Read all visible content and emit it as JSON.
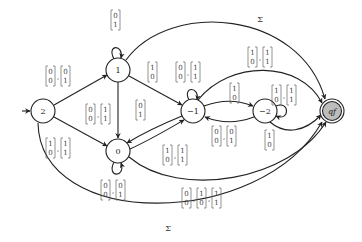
{
  "diagram": {
    "type": "finite-automaton",
    "start_state": "2",
    "states": [
      {
        "id": "2",
        "label": "2",
        "x": 43,
        "y": 111,
        "final": false,
        "start": true
      },
      {
        "id": "1",
        "label": "1",
        "x": 118,
        "y": 70,
        "final": false
      },
      {
        "id": "0",
        "label": "0",
        "x": 118,
        "y": 151,
        "final": false
      },
      {
        "id": "-1",
        "label": "−1",
        "x": 193,
        "y": 111,
        "final": false
      },
      {
        "id": "-2",
        "label": "−2",
        "x": 265,
        "y": 111,
        "final": false
      },
      {
        "id": "qf",
        "label": "qₑ",
        "display": "qf",
        "x": 332,
        "y": 111,
        "final": true
      }
    ],
    "edges": [
      {
        "from": "2",
        "to": "1",
        "label": "[0 0],[0 1]"
      },
      {
        "from": "2",
        "to": "0",
        "label": "[1 0],[1 1]"
      },
      {
        "from": "2",
        "to": "qf",
        "label": "Σ"
      },
      {
        "from": "1",
        "to": "1",
        "label": "[0 1]"
      },
      {
        "from": "1",
        "to": "0",
        "label": "[0 0],[1 1]"
      },
      {
        "from": "1",
        "to": "-1",
        "label": "[1 0]"
      },
      {
        "from": "1",
        "to": "qf",
        "label": "Σ"
      },
      {
        "from": "-1",
        "to": "0",
        "label": "[0 1]"
      },
      {
        "from": "0",
        "to": "0",
        "label": "[0 0],[0 1]"
      },
      {
        "from": "0",
        "to": "-1",
        "label": "[1 0],[1 1]"
      },
      {
        "from": "0",
        "to": "qf",
        "label": "[0 0],[1 0],[1 1]"
      },
      {
        "from": "-1",
        "to": "-1",
        "label": "[0 0],[1 1]"
      },
      {
        "from": "-1",
        "to": "-2",
        "label": "[1 0]"
      },
      {
        "from": "-1",
        "to": "qf",
        "label": "[1 0],[1 1]"
      },
      {
        "from": "-2",
        "to": "-1",
        "label": "[0 0],[0 1]"
      },
      {
        "from": "-2",
        "to": "-2",
        "label": "[1 0],[1 1]"
      },
      {
        "from": "-2",
        "to": "qf",
        "label": "[1 0]"
      }
    ],
    "sigma_label": "Σ",
    "final_label": "qf"
  }
}
